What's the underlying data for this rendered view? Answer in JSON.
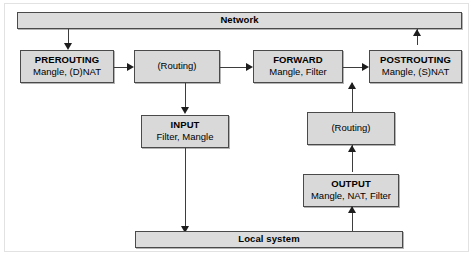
{
  "diagram": {
    "type": "flow",
    "title_bar_top": {
      "label": "Network"
    },
    "title_bar_bottom": {
      "label": "Local system"
    },
    "nodes": [
      {
        "id": "network",
        "kind": "bar",
        "label": "Network",
        "sub": ""
      },
      {
        "id": "prerouting",
        "kind": "chain",
        "label": "PREROUTING",
        "sub": "Mangle, (D)NAT"
      },
      {
        "id": "routing-top",
        "kind": "routing",
        "label": "(Routing)",
        "sub": ""
      },
      {
        "id": "forward",
        "kind": "chain",
        "label": "FORWARD",
        "sub": "Mangle, Filter"
      },
      {
        "id": "postrouting",
        "kind": "chain",
        "label": "POSTROUTING",
        "sub": "Mangle, (S)NAT"
      },
      {
        "id": "input",
        "kind": "chain",
        "label": "INPUT",
        "sub": "Filter, Mangle"
      },
      {
        "id": "routing-low",
        "kind": "routing",
        "label": "(Routing)",
        "sub": ""
      },
      {
        "id": "output",
        "kind": "chain",
        "label": "OUTPUT",
        "sub": "Mangle, NAT, Filter"
      },
      {
        "id": "local-system",
        "kind": "bar",
        "label": "Local system",
        "sub": ""
      }
    ],
    "edges": [
      {
        "from": "network",
        "to": "prerouting",
        "direction": "down"
      },
      {
        "from": "prerouting",
        "to": "routing-top",
        "direction": "right"
      },
      {
        "from": "routing-top",
        "to": "forward",
        "direction": "right"
      },
      {
        "from": "forward",
        "to": "postrouting",
        "direction": "right"
      },
      {
        "from": "postrouting",
        "to": "network",
        "direction": "up"
      },
      {
        "from": "routing-top",
        "to": "input",
        "direction": "down"
      },
      {
        "from": "input",
        "to": "local-system",
        "direction": "down"
      },
      {
        "from": "local-system",
        "to": "output",
        "direction": "up"
      },
      {
        "from": "output",
        "to": "routing-low",
        "direction": "up"
      },
      {
        "from": "routing-low",
        "to": "forward",
        "direction": "up"
      }
    ],
    "colors": {
      "node_fill": "#d9d9d9",
      "bar_fill": "#dcdcdc",
      "node_border": "#4a4a4a",
      "line": "#3d3d3d",
      "arrow": "#1d1d1d",
      "background": "#ffffff"
    }
  }
}
